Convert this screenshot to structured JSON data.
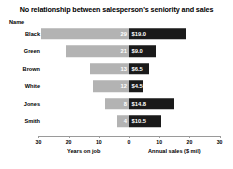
{
  "chart_data": {
    "type": "bar",
    "title": "No relationship between salesperson's seniority and sales",
    "subtype": "diverging-bidirectional-bar",
    "name_column_header": "Name",
    "categories": [
      "Black",
      "Green",
      "Brown",
      "White",
      "Jones",
      "Smith"
    ],
    "series": [
      {
        "name": "Years on job",
        "side": "left",
        "color": "#b3b3b3",
        "values": [
          29,
          21,
          13,
          12,
          8,
          4
        ],
        "value_labels": [
          "29",
          "21",
          "13",
          "12",
          "8",
          "4"
        ]
      },
      {
        "name": "Annual sales ($ mil)",
        "side": "right",
        "color": "#1a1a1a",
        "values": [
          19.0,
          9.0,
          6.5,
          4.5,
          14.8,
          10.5
        ],
        "value_labels": [
          "$19.0",
          "$9.0",
          "$6.5",
          "$4.5",
          "$14.8",
          "$10.5"
        ]
      }
    ],
    "xlabel_left": "Years on job",
    "xlabel_right": "Annual sales ($ mil)",
    "ylabel": "",
    "axis_ticks": [
      {
        "label": "30",
        "side": "left",
        "value": 30
      },
      {
        "label": "20",
        "side": "left",
        "value": 20
      },
      {
        "label": "10",
        "side": "left",
        "value": 10
      },
      {
        "label": "0",
        "side": "center",
        "value": 0
      },
      {
        "label": "10",
        "side": "right",
        "value": 10
      },
      {
        "label": "20",
        "side": "right",
        "value": 20
      },
      {
        "label": "30",
        "side": "right",
        "value": 30
      }
    ],
    "xlim_left": [
      0,
      30
    ],
    "xlim_right": [
      0,
      30
    ],
    "grid": false,
    "legend": "none"
  }
}
